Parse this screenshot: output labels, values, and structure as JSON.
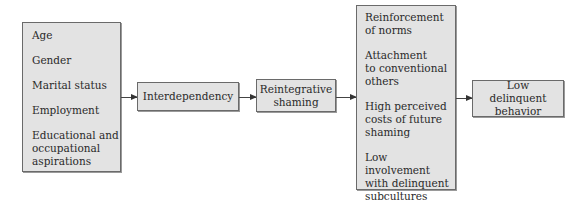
{
  "diagram": {
    "boxes": {
      "individual_factors": {
        "items": [
          "Age",
          "Gender",
          "Marital status",
          "Employment",
          "Educational and\noccupational\naspirations"
        ]
      },
      "interdependency": {
        "label": "Interdependency"
      },
      "reintegrative_shaming": {
        "label": "Reintegrative\nshaming"
      },
      "mechanisms": {
        "items": [
          "Reinforcement\nof norms",
          "Attachment\nto conventional\nothers",
          "High perceived\ncosts of future\nshaming",
          "Low involvement\nwith delinquent\nsubcultures"
        ]
      },
      "outcome": {
        "label": "Low delinquent\nbehavior"
      }
    },
    "edges": [
      {
        "from": "individual_factors",
        "to": "interdependency"
      },
      {
        "from": "interdependency",
        "to": "reintegrative_shaming"
      },
      {
        "from": "reintegrative_shaming",
        "to": "mechanisms"
      },
      {
        "from": "mechanisms",
        "to": "outcome"
      }
    ],
    "colors": {
      "box_fill": "#e3e3e3",
      "box_border": "#6a6a6a",
      "arrow": "#333333",
      "text": "#2a2a2a"
    }
  }
}
